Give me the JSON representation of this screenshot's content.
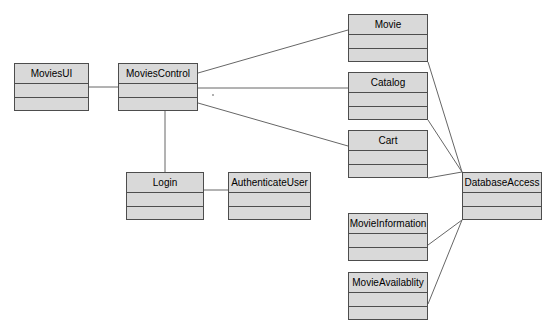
{
  "diagram": {
    "type": "uml-class-diagram",
    "background_color": "#ffffff",
    "class_fill_color": "#d9d9d9",
    "class_border_color": "#4d4d4d",
    "edge_color": "#666666",
    "classes": [
      {
        "id": "movies-ui",
        "name": "MoviesUI",
        "x": 14,
        "y": 63,
        "w": 75,
        "h": 48
      },
      {
        "id": "movies-control",
        "name": "MoviesControl",
        "x": 118,
        "y": 63,
        "w": 80,
        "h": 48
      },
      {
        "id": "login",
        "name": "Login",
        "x": 126,
        "y": 172,
        "w": 78,
        "h": 48
      },
      {
        "id": "authenticate-user",
        "name": "AuthenticateUser",
        "x": 228,
        "y": 172,
        "w": 83,
        "h": 48
      },
      {
        "id": "movie",
        "name": "Movie",
        "x": 348,
        "y": 14,
        "w": 80,
        "h": 48
      },
      {
        "id": "catalog",
        "name": "Catalog",
        "x": 348,
        "y": 72,
        "w": 80,
        "h": 48
      },
      {
        "id": "cart",
        "name": "Cart",
        "x": 348,
        "y": 130,
        "w": 80,
        "h": 48
      },
      {
        "id": "movie-information",
        "name": "MovieInformation",
        "x": 348,
        "y": 213,
        "w": 80,
        "h": 48
      },
      {
        "id": "movie-availablity",
        "name": "MovieAvailablity",
        "x": 348,
        "y": 272,
        "w": 80,
        "h": 48
      },
      {
        "id": "database-access",
        "name": "DatabaseAccess",
        "x": 462,
        "y": 172,
        "w": 80,
        "h": 48
      }
    ],
    "associations": [
      {
        "id": "moviesui-moviescontrol",
        "from": "movies-ui",
        "to": "movies-control",
        "points": "89,87 118,87"
      },
      {
        "id": "moviescontrol-movie",
        "from": "movies-control",
        "to": "movie",
        "points": "198,73 348,30"
      },
      {
        "id": "moviescontrol-catalog",
        "from": "movies-control",
        "to": "catalog",
        "points": "198,88 348,88"
      },
      {
        "id": "moviescontrol-cart",
        "from": "movies-control",
        "to": "cart",
        "points": "198,103 348,146"
      },
      {
        "id": "moviescontrol-login",
        "from": "movies-control",
        "to": "login",
        "points": "165,111 165,172"
      },
      {
        "id": "login-authenticateuser",
        "from": "login",
        "to": "authenticate-user",
        "points": "204,190 228,190"
      },
      {
        "id": "movie-databaseaccess",
        "from": "movie",
        "to": "database-access",
        "points": "428,62 462,172"
      },
      {
        "id": "catalog-databaseaccess",
        "from": "catalog",
        "to": "database-access",
        "points": "428,120 462,172"
      },
      {
        "id": "cart-databaseaccess",
        "from": "cart",
        "to": "database-access",
        "points": "428,178 462,172"
      },
      {
        "id": "movieinformation-dbaccess",
        "from": "movie-information",
        "to": "database-access",
        "points": "428,245 462,220"
      },
      {
        "id": "movieavailablity-dbaccess",
        "from": "movie-availablity",
        "to": "database-access",
        "points": "428,304 462,220"
      }
    ]
  }
}
